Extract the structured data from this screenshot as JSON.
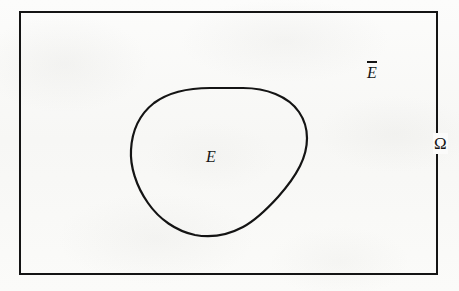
{
  "figure": {
    "kind": "set-complement-venn-diagram",
    "width": 459,
    "height": 291,
    "background_color": "#fbfbfa",
    "ink_color": "#141414"
  },
  "universe": {
    "name": "universe-rectangle",
    "label": "Ω",
    "label_name": "omega",
    "border_color": "#141414",
    "border_width_px": 2,
    "x": 20,
    "y": 12,
    "width": 417,
    "height": 262,
    "label_x": 440,
    "label_y": 143
  },
  "set": {
    "name": "set-blob",
    "label": "E",
    "stroke_color": "#141414",
    "stroke_width_px": 2.2,
    "fill": "none",
    "bbox": {
      "x": 130,
      "y": 88,
      "width": 177,
      "height": 149
    },
    "label_x": 212,
    "label_y": 157,
    "path": "M 243 88 C 273 89 296 103 304 122 C 312 141 308 160 295 180 C 283 199 266 217 245 228 C 224 239 201 240 182 232 C 163 224 148 207 139 188 C 130 169 128 147 134 129 C 141 110 158 97 178 92 C 198 87 221 87 243 88 Z"
  },
  "complement": {
    "name": "complement-region",
    "label_base": "E",
    "label_accent": "overbar",
    "label_text": "Ē",
    "label_x": 373,
    "label_y": 70
  },
  "labels": {
    "set_e": "E",
    "complement_e": "E",
    "omega": "Ω"
  }
}
